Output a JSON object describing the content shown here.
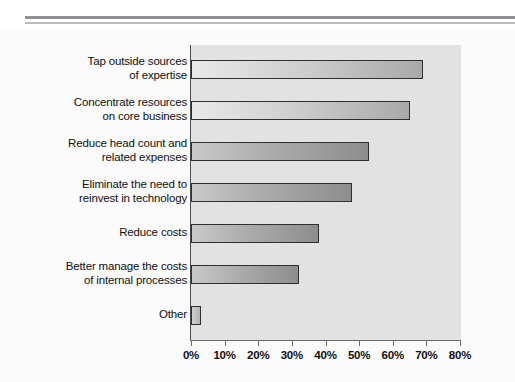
{
  "figure": {
    "top_rule": "double-horizontal-rule"
  },
  "chart_data": {
    "type": "bar",
    "orientation": "horizontal",
    "title": "",
    "subtitle": "",
    "xlabel": "",
    "ylabel": "",
    "xlim": [
      0,
      80
    ],
    "grid": false,
    "legend": null,
    "tick_labels": [
      "0%",
      "10%",
      "20%",
      "30%",
      "40%",
      "50%",
      "60%",
      "70%",
      "80%"
    ],
    "tick_values": [
      0,
      10,
      20,
      30,
      40,
      50,
      60,
      70,
      80
    ],
    "categories": [
      "Tap outside sources of expertise",
      "Concentrate resources on core business",
      "Reduce head count and related expenses",
      "Eliminate the need to reinvest in technology",
      "Reduce costs",
      "Better manage the costs of internal processes",
      "Other"
    ],
    "category_lines": [
      [
        "Tap outside sources",
        "of expertise"
      ],
      [
        "Concentrate resources",
        "on core business"
      ],
      [
        "Reduce head count and",
        "related expenses"
      ],
      [
        "Eliminate the need to",
        "reinvest in technology"
      ],
      [
        "Reduce costs"
      ],
      [
        "Better manage the costs",
        "of internal processes"
      ],
      [
        "Other"
      ]
    ],
    "values": [
      69,
      65,
      53,
      48,
      38,
      32,
      3
    ],
    "value_labels": [
      "69%",
      "65%",
      "53%",
      "48%",
      "38%",
      "32%",
      "3%"
    ],
    "colors": {
      "plot_background": "#e2e2e2",
      "figure_background": "#fbfbfb",
      "bar_outline": "#2f2f2f",
      "bar_fill_light": "#e9e9e9",
      "bar_fill_dark": "#8d8d8d",
      "axis": "#6b6b6b",
      "text": "#101010",
      "rule_thick": "#8f9194",
      "rule_thin": "#b9bbbe"
    }
  }
}
